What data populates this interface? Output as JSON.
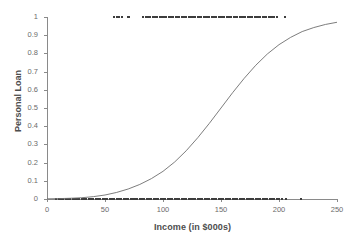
{
  "chart_data": {
    "type": "scatter",
    "title": "",
    "xlabel": "Income (in $000s)",
    "ylabel": "Personal Loan",
    "xlim": [
      0,
      250
    ],
    "ylim": [
      0,
      1
    ],
    "xticks": [
      "0",
      "50",
      "100",
      "150",
      "200",
      "250"
    ],
    "xtick_values": [
      0,
      50,
      100,
      150,
      200,
      250
    ],
    "yticks": [
      "0",
      "0.1",
      "0.2",
      "0.3",
      "0.4",
      "0.5",
      "0.6",
      "0.7",
      "0.8",
      "0.9",
      "1"
    ],
    "ytick_values": [
      0,
      0.1,
      0.2,
      0.3,
      0.4,
      0.5,
      0.6,
      0.7,
      0.8,
      0.9,
      1
    ],
    "grid": false,
    "legend": null,
    "series": [
      {
        "name": "Personal Loan = 1",
        "type": "scatter",
        "marker": "square",
        "color": "#3d3d3d",
        "y": 1,
        "x": [
          58,
          60,
          62,
          65,
          70,
          71,
          83,
          85,
          87,
          89,
          91,
          93,
          95,
          97,
          99,
          101,
          103,
          105,
          107,
          109,
          111,
          113,
          114,
          116,
          118,
          120,
          122,
          124,
          126,
          128,
          130,
          131,
          133,
          135,
          137,
          139,
          140,
          142,
          144,
          146,
          148,
          150,
          151,
          153,
          155,
          157,
          159,
          161,
          162,
          164,
          166,
          168,
          170,
          171,
          173,
          175,
          177,
          179,
          180,
          182,
          184,
          186,
          188,
          189,
          191,
          193,
          194,
          196,
          198,
          205
        ]
      },
      {
        "name": "Personal Loan = 0",
        "type": "scatter",
        "marker": "square",
        "color": "#3d3d3d",
        "y": 0,
        "x": [
          8,
          10,
          12,
          14,
          16,
          18,
          20,
          22,
          24,
          26,
          28,
          30,
          32,
          34,
          36,
          38,
          40,
          42,
          44,
          46,
          48,
          50,
          52,
          54,
          56,
          58,
          60,
          62,
          64,
          66,
          68,
          70,
          72,
          74,
          76,
          78,
          80,
          82,
          84,
          86,
          88,
          90,
          92,
          94,
          96,
          98,
          100,
          102,
          104,
          106,
          108,
          110,
          112,
          114,
          116,
          118,
          120,
          122,
          124,
          126,
          128,
          130,
          132,
          134,
          136,
          138,
          140,
          142,
          144,
          146,
          148,
          150,
          152,
          154,
          156,
          158,
          160,
          162,
          164,
          166,
          168,
          170,
          172,
          174,
          176,
          178,
          180,
          182,
          184,
          186,
          188,
          190,
          192,
          194,
          196,
          198,
          200,
          203,
          206,
          219
        ]
      },
      {
        "name": "Logistic fit",
        "type": "line",
        "color": "#6e6e6e",
        "points": [
          [
            0,
            0.001
          ],
          [
            10,
            0.002
          ],
          [
            20,
            0.004
          ],
          [
            30,
            0.007
          ],
          [
            40,
            0.013
          ],
          [
            50,
            0.022
          ],
          [
            60,
            0.036
          ],
          [
            70,
            0.055
          ],
          [
            80,
            0.08
          ],
          [
            90,
            0.112
          ],
          [
            100,
            0.152
          ],
          [
            110,
            0.203
          ],
          [
            120,
            0.265
          ],
          [
            130,
            0.337
          ],
          [
            140,
            0.416
          ],
          [
            150,
            0.5
          ],
          [
            160,
            0.584
          ],
          [
            170,
            0.663
          ],
          [
            180,
            0.735
          ],
          [
            190,
            0.797
          ],
          [
            200,
            0.848
          ],
          [
            210,
            0.888
          ],
          [
            220,
            0.92
          ],
          [
            230,
            0.942
          ],
          [
            240,
            0.959
          ],
          [
            250,
            0.971
          ]
        ]
      }
    ]
  }
}
